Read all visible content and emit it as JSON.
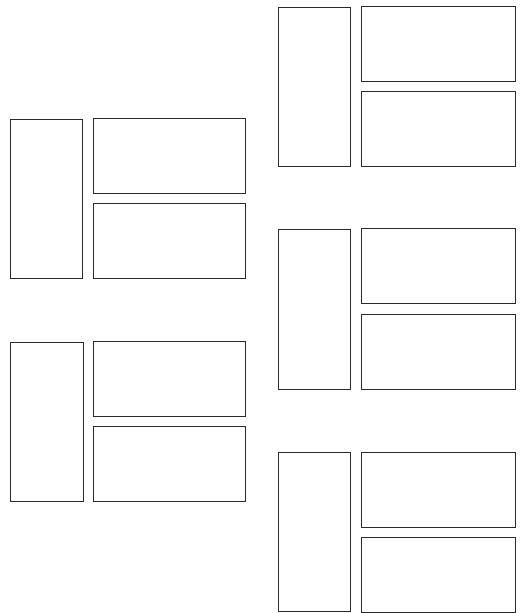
{
  "diagram": {
    "stroke_color": "#2a2a2a",
    "background": "#ffffff",
    "groups": [
      {
        "id": "group-a",
        "tall": [
          10,
          119,
          73,
          160
        ],
        "top": [
          93,
          118,
          153,
          76
        ],
        "bottom": [
          93,
          203,
          153,
          76
        ]
      },
      {
        "id": "group-b",
        "tall": [
          10,
          342,
          74,
          160
        ],
        "top": [
          93,
          341,
          153,
          76
        ],
        "bottom": [
          93,
          426,
          153,
          76
        ]
      },
      {
        "id": "group-c",
        "tall": [
          278,
          7,
          73,
          160
        ],
        "top": [
          361,
          6,
          155,
          76
        ],
        "bottom": [
          361,
          91,
          155,
          76
        ]
      },
      {
        "id": "group-d",
        "tall": [
          278,
          229,
          73,
          161
        ],
        "top": [
          361,
          228,
          155,
          76
        ],
        "bottom": [
          361,
          314,
          155,
          76
        ]
      },
      {
        "id": "group-e",
        "tall": [
          278,
          452,
          73,
          160
        ],
        "top": [
          361,
          452,
          155,
          76
        ],
        "bottom": [
          361,
          537,
          155,
          76
        ]
      }
    ]
  }
}
